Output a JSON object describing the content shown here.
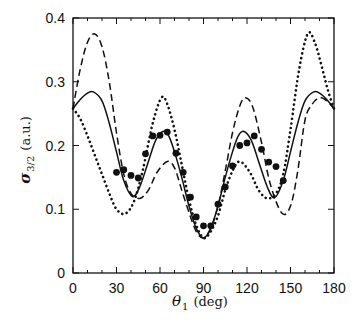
{
  "chart_data": {
    "type": "line",
    "title": "",
    "xlabel": "θ_1 (deg)",
    "xlabel_parts": {
      "symbol": "θ",
      "subscript": "1",
      "unit": "(deg)"
    },
    "ylabel": "σ_3/2 (a.u.)",
    "ylabel_parts": {
      "symbol": "σ",
      "subscript": "3/2",
      "unit": "(a.u.)"
    },
    "xlim": [
      0,
      180
    ],
    "ylim": [
      0,
      0.4
    ],
    "xticks": [
      0,
      30,
      60,
      90,
      120,
      150,
      180
    ],
    "xtick_labels": [
      "0",
      "30",
      "60",
      "90",
      "120",
      "150",
      "180"
    ],
    "yticks": [
      0,
      0.1,
      0.2,
      0.3,
      0.4
    ],
    "ytick_labels": [
      "0",
      "0.1",
      "0.2",
      "0.3",
      "0.4"
    ],
    "grid": false,
    "legend": null,
    "series": [
      {
        "name": "solid",
        "style": "solid",
        "x": [
          0,
          5,
          10,
          14,
          20,
          25,
          30,
          35,
          41,
          46,
          52,
          57,
          62,
          66,
          70,
          75,
          80,
          85,
          90,
          95,
          100,
          105,
          110,
          114,
          118,
          123,
          128,
          134,
          139,
          145,
          150,
          155,
          160,
          166,
          170,
          175,
          180
        ],
        "y": [
          0.258,
          0.272,
          0.282,
          0.284,
          0.27,
          0.235,
          0.19,
          0.145,
          0.12,
          0.135,
          0.175,
          0.208,
          0.222,
          0.215,
          0.19,
          0.15,
          0.105,
          0.07,
          0.055,
          0.07,
          0.105,
          0.15,
          0.19,
          0.215,
          0.222,
          0.208,
          0.175,
          0.135,
          0.118,
          0.145,
          0.19,
          0.235,
          0.27,
          0.284,
          0.282,
          0.272,
          0.258
        ]
      },
      {
        "name": "dashed",
        "style": "dashed",
        "x": [
          0,
          5,
          10,
          15,
          20,
          25,
          30,
          35,
          40,
          46,
          52,
          58,
          65,
          70,
          75,
          80,
          85,
          90,
          95,
          100,
          105,
          110,
          115,
          119,
          124,
          130,
          136,
          144,
          150,
          155,
          160,
          165,
          170,
          175,
          180
        ],
        "y": [
          0.258,
          0.32,
          0.362,
          0.375,
          0.355,
          0.3,
          0.22,
          0.155,
          0.125,
          0.117,
          0.13,
          0.158,
          0.175,
          0.165,
          0.13,
          0.095,
          0.065,
          0.055,
          0.07,
          0.105,
          0.16,
          0.22,
          0.262,
          0.275,
          0.26,
          0.205,
          0.14,
          0.094,
          0.105,
          0.16,
          0.24,
          0.265,
          0.275,
          0.27,
          0.258
        ]
      },
      {
        "name": "dotted",
        "style": "dotted",
        "x": [
          0,
          5,
          10,
          15,
          20,
          25,
          30,
          36,
          42,
          48,
          55,
          61,
          65,
          70,
          75,
          80,
          85,
          90,
          95,
          100,
          105,
          110,
          115,
          122,
          128,
          134,
          140,
          145,
          150,
          156,
          162,
          167,
          172,
          176,
          180
        ],
        "y": [
          0.258,
          0.242,
          0.215,
          0.185,
          0.155,
          0.125,
          0.1,
          0.093,
          0.112,
          0.16,
          0.235,
          0.275,
          0.265,
          0.225,
          0.17,
          0.115,
          0.075,
          0.055,
          0.065,
          0.09,
          0.13,
          0.16,
          0.175,
          0.158,
          0.13,
          0.117,
          0.125,
          0.155,
          0.225,
          0.32,
          0.376,
          0.36,
          0.32,
          0.285,
          0.258
        ]
      },
      {
        "name": "data points",
        "style": "markers",
        "x": [
          30,
          35,
          40,
          45,
          50,
          55,
          60,
          65,
          71,
          76,
          81,
          85,
          90,
          95,
          100,
          105,
          110,
          115,
          120,
          125,
          130,
          135,
          140,
          145
        ],
        "y": [
          0.158,
          0.162,
          0.153,
          0.149,
          0.187,
          0.215,
          0.216,
          0.221,
          0.188,
          0.158,
          0.119,
          0.088,
          0.074,
          0.074,
          0.108,
          0.135,
          0.168,
          0.2,
          0.204,
          0.215,
          0.194,
          0.174,
          0.167,
          0.145
        ]
      }
    ]
  }
}
